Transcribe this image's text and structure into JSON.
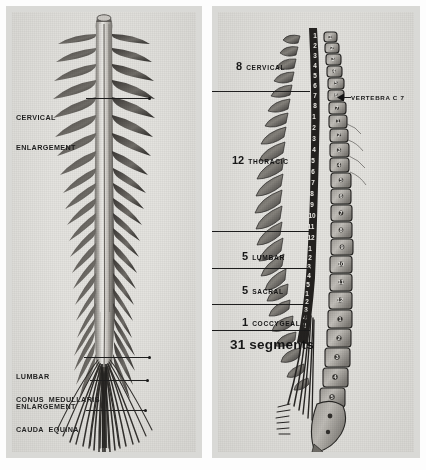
{
  "figure": {
    "background_color": "#e4e3df",
    "ink_color": "#1b1b1b"
  },
  "left_panel": {
    "name": "spinal-cord-posterior-view",
    "labels": [
      {
        "id": "cervical-enlargement",
        "line1": "CERVICAL",
        "line2": "ENLARGEMENT"
      },
      {
        "id": "lumbar-enlargement",
        "line1": "LUMBAR",
        "line2": "ENLARGEMENT"
      },
      {
        "id": "conus-medullaris",
        "line1": "CONUS  MEDULLARIS",
        "line2": ""
      },
      {
        "id": "cauda-equina",
        "line1": "CAUDA  EQUINA",
        "line2": ""
      }
    ]
  },
  "right_panel": {
    "name": "vertebral-column-lateral-view",
    "segments": [
      {
        "id": "cervical",
        "count": "8",
        "name": "CERVICAL"
      },
      {
        "id": "thoracic",
        "count": "12",
        "name": "THORACIC"
      },
      {
        "id": "lumbar",
        "count": "5",
        "name": "LUMBAR"
      },
      {
        "id": "sacral",
        "count": "5",
        "name": "SACRAL"
      },
      {
        "id": "coccygeal",
        "count": "1",
        "name": "COCCYGEAL"
      }
    ],
    "total_label": "31 segments",
    "vertebra_callout": "VERTEBRA C 7",
    "cord_segment_numbers": [
      "1",
      "2",
      "3",
      "4",
      "5",
      "6",
      "7",
      "8",
      "9",
      "10",
      "11",
      "12",
      "1",
      "2",
      "3",
      "4",
      "5",
      "1",
      "2",
      "3",
      "4",
      "5"
    ],
    "vertebra_numbers": [
      "1",
      "2",
      "3",
      "4",
      "5",
      "6",
      "7",
      "8",
      "9",
      "10",
      "11",
      "12",
      "1",
      "2",
      "3",
      "4",
      "5"
    ]
  }
}
